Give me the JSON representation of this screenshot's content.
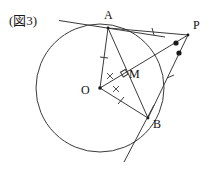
{
  "figure": {
    "caption": "(図3)",
    "type": "euclidean-geometry-diagram",
    "background_color": "#ffffff",
    "stroke_color": "#3a3a3a",
    "label_color": "#111111"
  },
  "points": [
    {
      "id": "A",
      "label": "A",
      "x": 108,
      "y": 28,
      "on_circle": true
    },
    {
      "id": "P",
      "label": "P",
      "x": 188,
      "y": 35,
      "on_circle": false
    },
    {
      "id": "O",
      "label": "O",
      "x": 100,
      "y": 88,
      "on_circle": false
    },
    {
      "id": "M",
      "label": "M",
      "x": 124,
      "y": 73,
      "on_circle": false
    },
    {
      "id": "B",
      "label": "B",
      "x": 148,
      "y": 118,
      "on_circle": true
    }
  ],
  "circle": {
    "center_x": 100,
    "center_y": 88,
    "radius": 64
  },
  "segments": [
    {
      "name": "tangent-line-through-A",
      "from": "tangent-A-start",
      "to": "tangent-A-end",
      "x1": 61,
      "y1": 21,
      "x2": 150,
      "y2": 35
    },
    {
      "name": "segment-AP",
      "from": "A",
      "to": "P",
      "x1": 108,
      "y1": 28,
      "x2": 188,
      "y2": 35
    },
    {
      "name": "segment-BP",
      "from": "B",
      "to": "P",
      "x1": 148,
      "y1": 118,
      "x2": 188,
      "y2": 35
    },
    {
      "name": "tangent-line-through-B",
      "from": "B",
      "to": "tangent-B-end",
      "x1": 148,
      "y1": 118,
      "x2": 126,
      "y2": 160
    },
    {
      "name": "segment-OA",
      "from": "O",
      "to": "A",
      "x1": 100,
      "y1": 88,
      "x2": 108,
      "y2": 28
    },
    {
      "name": "segment-OB",
      "from": "O",
      "to": "B",
      "x1": 100,
      "y1": 88,
      "x2": 148,
      "y2": 118
    },
    {
      "name": "segment-OP",
      "from": "O",
      "to": "P",
      "x1": 100,
      "y1": 88,
      "x2": 188,
      "y2": 35
    },
    {
      "name": "chord-AB",
      "from": "A",
      "to": "B",
      "x1": 108,
      "y1": 28,
      "x2": 148,
      "y2": 118
    }
  ],
  "marks": {
    "tick_marks": [
      {
        "name": "tick-on-AP",
        "segment": "segment-AP",
        "x": 153,
        "y": 31,
        "angle": 95,
        "count": 1
      },
      {
        "name": "tick-on-BP",
        "segment": "segment-BP",
        "x": 170,
        "y": 77,
        "angle": 25,
        "count": 1
      },
      {
        "name": "tick-on-OA",
        "segment": "segment-OA",
        "x": 104,
        "y": 57,
        "angle": 82,
        "count": 1
      },
      {
        "name": "tick-on-OB",
        "segment": "segment-OB",
        "x": 121,
        "y": 101,
        "angle": 32,
        "count": 1
      }
    ],
    "angle_dots": [
      {
        "name": "angle-dot-APO",
        "x": 176,
        "y": 43
      },
      {
        "name": "angle-dot-OPB",
        "x": 179,
        "y": 53
      }
    ],
    "cross_marks": [
      {
        "name": "cross-angle-AOM",
        "x": 110,
        "y": 76,
        "label": "×"
      },
      {
        "name": "cross-angle-MOB",
        "x": 116,
        "y": 89,
        "label": "×"
      }
    ],
    "right_angle": {
      "name": "right-angle-at-M",
      "x": 124,
      "y": 73,
      "size": 5
    }
  },
  "labels": {
    "A": "A",
    "P": "P",
    "O": "O",
    "M": "M",
    "B": "B"
  }
}
